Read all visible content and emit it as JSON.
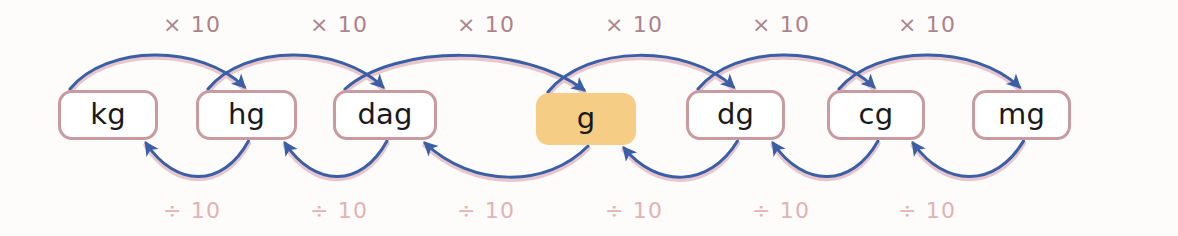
{
  "diagram": {
    "background_color": "#fdfcfb",
    "units": [
      {
        "id": "kg",
        "label": "kg",
        "x": 58,
        "width": 100,
        "highlighted": false
      },
      {
        "id": "hg",
        "label": "hg",
        "x": 196,
        "width": 101,
        "highlighted": false
      },
      {
        "id": "dag",
        "label": "dag",
        "x": 333,
        "width": 104,
        "highlighted": false
      },
      {
        "id": "g",
        "label": "g",
        "x": 536,
        "width": 100,
        "highlighted": true
      },
      {
        "id": "dg",
        "label": "dg",
        "x": 686,
        "width": 99,
        "highlighted": false
      },
      {
        "id": "cg",
        "label": "cg",
        "x": 827,
        "width": 98,
        "highlighted": false
      },
      {
        "id": "mg",
        "label": "mg",
        "x": 972,
        "width": 99,
        "highlighted": false
      }
    ],
    "box_top": 90,
    "box_height": 50,
    "multiply_labels": [
      {
        "text": "× 10",
        "x": 192,
        "y": 14
      },
      {
        "text": "× 10",
        "x": 339,
        "y": 14
      },
      {
        "text": "× 10",
        "x": 486,
        "y": 14
      },
      {
        "text": "× 10",
        "x": 634,
        "y": 14
      },
      {
        "text": "× 10",
        "x": 781,
        "y": 14
      },
      {
        "text": "× 10",
        "x": 927,
        "y": 14
      }
    ],
    "divide_labels": [
      {
        "text": "÷ 10",
        "x": 192,
        "y": 200
      },
      {
        "text": "÷ 10",
        "x": 339,
        "y": 200
      },
      {
        "text": "÷ 10",
        "x": 486,
        "y": 200
      },
      {
        "text": "÷ 10",
        "x": 634,
        "y": 200
      },
      {
        "text": "÷ 10",
        "x": 781,
        "y": 200
      },
      {
        "text": "÷ 10",
        "x": 927,
        "y": 200
      }
    ],
    "colors": {
      "arrow": "#3b5fa6",
      "arrow_fringe": "#d79aa6",
      "box_border": "#c89ba1",
      "box_fill": "#ffffff",
      "highlight_fill": "#f6cd84",
      "multiply_text": "#ad838c",
      "divide_text": "#e2b3b4",
      "unit_text": "#1a1a1a"
    },
    "arcs_forward": [
      {
        "from": "kg",
        "to": "hg",
        "operation": "× 10",
        "direction": "right"
      },
      {
        "from": "hg",
        "to": "dag",
        "operation": "× 10",
        "direction": "right"
      },
      {
        "from": "dag",
        "to": "g",
        "operation": "× 10",
        "direction": "right"
      },
      {
        "from": "g",
        "to": "dg",
        "operation": "× 10",
        "direction": "right"
      },
      {
        "from": "dg",
        "to": "cg",
        "operation": "× 10",
        "direction": "right"
      },
      {
        "from": "cg",
        "to": "mg",
        "operation": "× 10",
        "direction": "right"
      }
    ],
    "arcs_backward": [
      {
        "from": "hg",
        "to": "kg",
        "operation": "÷ 10",
        "direction": "left"
      },
      {
        "from": "dag",
        "to": "hg",
        "operation": "÷ 10",
        "direction": "left"
      },
      {
        "from": "g",
        "to": "dag",
        "operation": "÷ 10",
        "direction": "left"
      },
      {
        "from": "dg",
        "to": "g",
        "operation": "÷ 10",
        "direction": "left"
      },
      {
        "from": "cg",
        "to": "dg",
        "operation": "÷ 10",
        "direction": "left"
      },
      {
        "from": "mg",
        "to": "cg",
        "operation": "÷ 10",
        "direction": "left"
      }
    ]
  }
}
